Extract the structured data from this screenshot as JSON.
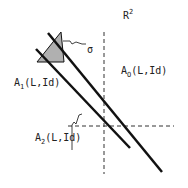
{
  "diagram": {
    "space_label": {
      "base": "R",
      "sup": "2"
    },
    "sigma_label": "σ",
    "labels": [
      {
        "id": "A1",
        "base": "A",
        "sub": "1",
        "args": "(L,Id)"
      },
      {
        "id": "A0",
        "base": "A",
        "sub": "O",
        "args": "(L,Id)"
      },
      {
        "id": "A2",
        "base": "A",
        "sub": "2",
        "args": "(L,Id)"
      }
    ],
    "colors": {
      "line": "#111111",
      "triangle_fill": "#b0b0b0",
      "dashed": "#333333"
    }
  }
}
